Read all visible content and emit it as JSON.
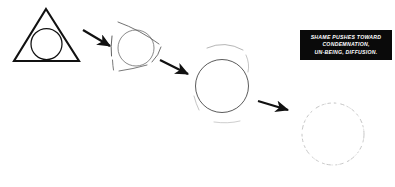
{
  "canvas": {
    "width": 395,
    "height": 187,
    "background_color": "#ffffff",
    "ink_color": "#111111"
  },
  "caption": {
    "name": "shame-caption",
    "background_color": "#0a0a0a",
    "text_color": "#ffffff",
    "lines": [
      "SHAME PUSHES TOWARD",
      "CONDEMNATION,",
      "UN-BEING, DIFFUSION."
    ],
    "full_text": "SHAME PUSHES TOWARD CONDEMNATION, UN-BEING, DIFFUSION."
  },
  "diagram": {
    "type": "progression-sequence",
    "stage_count": 4,
    "arrow_count": 3,
    "stages": [
      {
        "index": 1,
        "label": "intact-triangle-with-circle",
        "triangle_state": "solid",
        "circle_state": "solid",
        "stroke_weight": "heavy",
        "opacity": 1
      },
      {
        "index": 2,
        "label": "fracturing-triangle-with-circle",
        "triangle_state": "broken",
        "circle_state": "thin",
        "stroke_weight": "light",
        "opacity": 0.72
      },
      {
        "index": 3,
        "label": "fading-triangle-fragments-with-circle",
        "triangle_state": "fragments",
        "circle_state": "thin",
        "stroke_weight": "faint",
        "opacity": 0.55
      },
      {
        "index": 4,
        "label": "dissolving-circle",
        "triangle_state": "gone",
        "circle_state": "dissolving",
        "stroke_weight": "very-faint",
        "opacity": 0.3
      }
    ],
    "arrows": [
      {
        "index": 1,
        "from_stage": 1,
        "to_stage": 2,
        "direction": "down-right"
      },
      {
        "index": 2,
        "from_stage": 2,
        "to_stage": 3,
        "direction": "down-right"
      },
      {
        "index": 3,
        "from_stage": 3,
        "to_stage": 4,
        "direction": "right"
      }
    ]
  }
}
